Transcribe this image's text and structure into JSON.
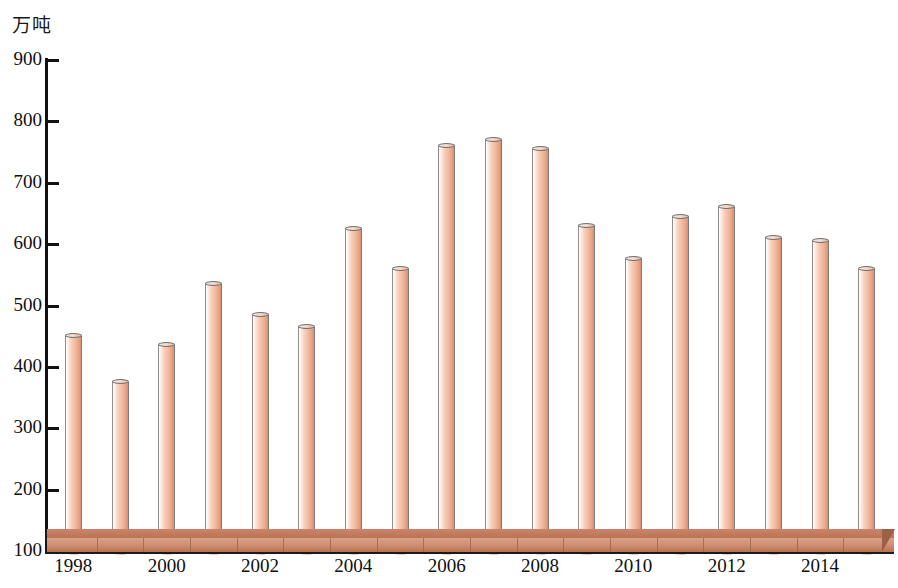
{
  "chart_data": {
    "type": "bar",
    "title": "",
    "subtitle": "",
    "xlabel": "",
    "ylabel": "万吨",
    "ylim": [
      100,
      900
    ],
    "ytick_step": 100,
    "yticks": [
      "900",
      "800",
      "700",
      "600",
      "500",
      "400",
      "300",
      "200",
      "100"
    ],
    "xticks_labeled": [
      "1998",
      "2000",
      "2002",
      "2004",
      "2006",
      "2008",
      "2010",
      "2012",
      "2014"
    ],
    "grid": false,
    "legend": null,
    "categories": [
      "1998",
      "1999",
      "2000",
      "2001",
      "2002",
      "2003",
      "2004",
      "2005",
      "2006",
      "2007",
      "2008",
      "2009",
      "2010",
      "2011",
      "2012",
      "2013",
      "2014",
      "2015"
    ],
    "values": [
      450,
      375,
      435,
      535,
      485,
      465,
      625,
      560,
      760,
      770,
      755,
      630,
      575,
      645,
      660,
      610,
      605,
      560
    ],
    "series": [
      {
        "name": "产量",
        "values": [
          450,
          375,
          435,
          535,
          485,
          465,
          625,
          560,
          760,
          770,
          755,
          630,
          575,
          645,
          660,
          610,
          605,
          560
        ]
      }
    ],
    "bar_style": "3d-cylinder",
    "bar_color": "#f2b99e",
    "bar_highlight_color": "#ffffff",
    "bar_shadow_color": "#d98f70",
    "base_platform_color": "#cf8d70",
    "axis_color": "#111111",
    "background_color": "#ffffff"
  },
  "axis": {
    "unit_label": "万吨",
    "y_min_label": "100",
    "y_max_label": "900"
  }
}
